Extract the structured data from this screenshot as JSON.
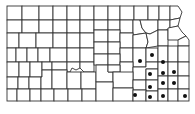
{
  "map": {
    "title": "Kansas county distribution map",
    "region": "Kansas",
    "colors": {
      "border": "#333333",
      "fill": "#ffffff",
      "marker": "#111111"
    },
    "marked_region": "southeast Kansas",
    "marker_count": 13,
    "legend": []
  }
}
